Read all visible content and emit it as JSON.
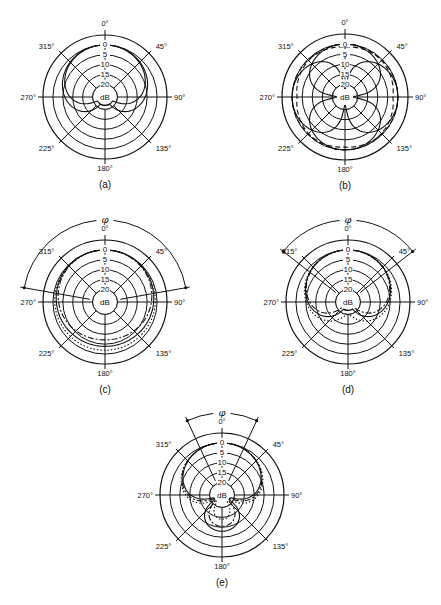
{
  "figure": {
    "panels": [
      {
        "id": "a",
        "caption": "(a)",
        "cx": 105,
        "cy": 97,
        "r": 62,
        "has_phi": false,
        "pattern": "cardioid-solid",
        "angles": [
          "0°",
          "45°",
          "90°",
          "135°",
          "180°",
          "225°",
          "270°",
          "315°"
        ],
        "rings_db": [
          "0",
          "5",
          "10",
          "15",
          "20"
        ],
        "center_label": "dB"
      },
      {
        "id": "b",
        "caption": "(b)",
        "cx": 345,
        "cy": 97,
        "r": 63,
        "has_phi": false,
        "pattern": "figure-eight-with-dashed",
        "angles": [
          "0°",
          "45°",
          "90°",
          "135°",
          "180°",
          "225°",
          "270°",
          "315°"
        ],
        "rings_db": [
          "0",
          "5",
          "10",
          "15",
          "20"
        ],
        "center_label": "dB"
      },
      {
        "id": "c",
        "caption": "(c)",
        "cx": 105,
        "cy": 302,
        "r": 62,
        "has_phi": true,
        "phi_label": "φ",
        "phi_half_angle": 80,
        "pattern": "omni-multi",
        "angles": [
          "0°",
          "45°",
          "90°",
          "135°",
          "180°",
          "225°",
          "270°",
          "315°"
        ],
        "rings_db": [
          "0",
          "5",
          "10",
          "15",
          "20"
        ],
        "center_label": "dB"
      },
      {
        "id": "d",
        "caption": "(d)",
        "cx": 348,
        "cy": 302,
        "r": 62,
        "has_phi": true,
        "phi_label": "φ",
        "phi_half_angle": 52,
        "pattern": "cardioid-multi",
        "angles": [
          "0°",
          "45°",
          "90°",
          "135°",
          "180°",
          "225°",
          "270°",
          "315°"
        ],
        "rings_db": [
          "0",
          "5",
          "10",
          "15",
          "20"
        ],
        "center_label": "dB"
      },
      {
        "id": "e",
        "caption": "(e)",
        "cx": 222,
        "cy": 495,
        "r": 62,
        "has_phi": true,
        "phi_label": "φ",
        "phi_half_angle": 25,
        "pattern": "hypercardioid-multi",
        "angles": [
          "0°",
          "45°",
          "90°",
          "135°",
          "180°",
          "225°",
          "270°",
          "315°"
        ],
        "rings_db": [
          "0",
          "5",
          "10",
          "15",
          "20"
        ],
        "center_label": "dB"
      }
    ],
    "style": {
      "line_color": "#111111",
      "background": "#ffffff"
    }
  }
}
